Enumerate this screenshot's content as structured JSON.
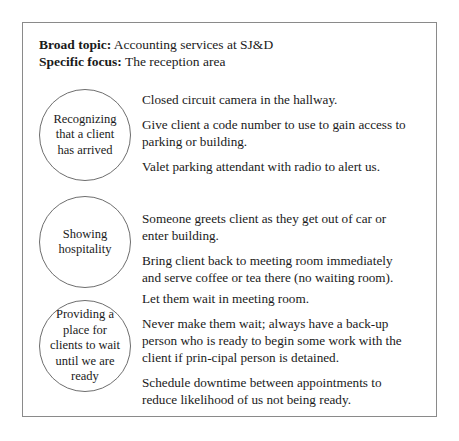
{
  "header": {
    "broad_topic_label": "Broad topic:",
    "broad_topic_value": "Accounting services at SJ&D",
    "specific_focus_label": "Specific focus:",
    "specific_focus_value": "The reception area"
  },
  "sections": [
    {
      "circle_label": "Recognizing that a client has arrived",
      "paragraphs": [
        "Closed circuit camera in the hallway.",
        "Give client a code number to use to gain access to parking or building.",
        "Valet parking attendant with radio to alert us."
      ]
    },
    {
      "circle_label": "Showing hospitality",
      "paragraphs": [
        "Someone greets client as they get out of car or enter building.",
        "Bring client back to meeting room immediately and serve coffee or tea there (no waiting room)."
      ]
    },
    {
      "circle_label": "Providing a place for clients to wait until we are ready",
      "paragraphs": [
        "Let them wait in meeting room.",
        "Never make them wait; always have a back-up person who is ready to begin some work with the client if prin-cipal person is detained.",
        "Schedule downtime between appointments to reduce likelihood of us not being ready."
      ]
    }
  ]
}
